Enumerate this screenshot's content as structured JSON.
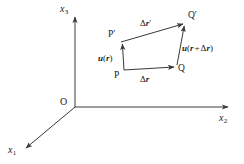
{
  "figure": {
    "background_color": "#ffffff",
    "line_color": "#3a3a3a",
    "text_color": "#1a1a1a",
    "axes": {
      "x1_label": "x",
      "x1_subscript": "1",
      "x2_label": "x",
      "x2_subscript": "2",
      "x3_label": "x",
      "x3_subscript": "3",
      "origin_label": "O"
    },
    "points": {
      "P": "P",
      "Q": "Q",
      "P_prime": "P′",
      "Q_prime": "Q′"
    },
    "vectors": {
      "delta_r": {
        "delta": "Δ",
        "symbol": "r",
        "prime": ""
      },
      "delta_r_prime": {
        "delta": "Δ",
        "symbol": "r",
        "prime": "′"
      },
      "u_r": {
        "field": "u",
        "open": "(",
        "arg": "r",
        "close": ")"
      },
      "u_r_plus_delta_r": {
        "field": "u",
        "open": "(",
        "arg": "r",
        "plus": "+",
        "delta": "Δ",
        "arg2": "r",
        "close": ")"
      }
    }
  }
}
